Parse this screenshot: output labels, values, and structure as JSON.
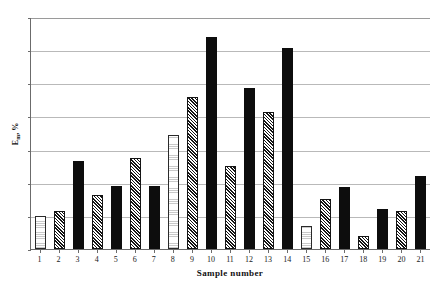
{
  "chart_data": {
    "type": "bar",
    "title": "",
    "xlabel": "Sample number",
    "ylabel": "Em, %",
    "ylabel_base": "E",
    "ylabel_sub": "m",
    "ylabel_suffix": ", %",
    "categories": [
      "1",
      "2",
      "3",
      "4",
      "5",
      "6",
      "7",
      "8",
      "9",
      "10",
      "11",
      "12",
      "13",
      "14",
      "15",
      "16",
      "17",
      "18",
      "19",
      "20",
      "21"
    ],
    "values": [
      5.0,
      5.8,
      13.3,
      8.2,
      9.5,
      13.7,
      9.5,
      17.2,
      22.9,
      32.0,
      12.5,
      24.3,
      20.7,
      30.4,
      3.5,
      7.5,
      9.4,
      2.0,
      6.0,
      5.8,
      11.0
    ],
    "patterns": [
      "dotted",
      "hatch",
      "solid",
      "hatch",
      "solid",
      "hatch",
      "solid",
      "dotted",
      "hatch",
      "solid",
      "hatch",
      "solid",
      "hatch",
      "solid",
      "dotted",
      "hatch",
      "solid",
      "hatch",
      "solid",
      "hatch",
      "solid"
    ],
    "ylim": [
      0,
      35
    ],
    "yticks": [
      0,
      5,
      10,
      15,
      20,
      25,
      30,
      35
    ],
    "grid": true,
    "legend": "none",
    "colors": {
      "solid": "#0d0d0d",
      "hatch_line": "#141414",
      "dotted_fill": "#c9c9c9",
      "gridline": "#b9b9b9",
      "axis": "#6b6b6b",
      "background": "#ffffff",
      "text": "#1a1a1a"
    }
  }
}
